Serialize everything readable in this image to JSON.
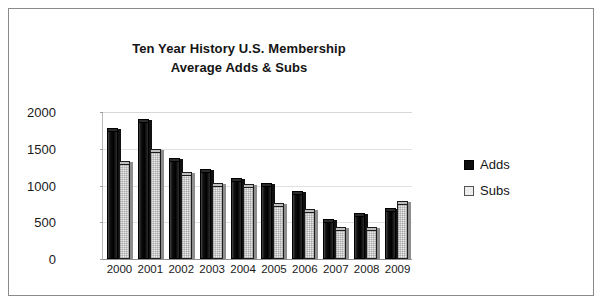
{
  "chart_data": {
    "type": "bar",
    "title": "Ten Year History U.S. Membership",
    "subtitle": "Average Adds & Subs",
    "title_lines": [
      "Ten Year History U.S. Membership",
      "Average Adds & Subs"
    ],
    "xlabel": "",
    "ylabel": "",
    "ylim": [
      0,
      2000
    ],
    "yticks": [
      0,
      500,
      1000,
      1500,
      2000
    ],
    "ytick_labels": [
      "0",
      "500",
      "1000",
      "1500",
      "2000"
    ],
    "grid": true,
    "legend_position": "right",
    "categories": [
      "2000",
      "2001",
      "2002",
      "2003",
      "2004",
      "2005",
      "2006",
      "2007",
      "2008",
      "2009"
    ],
    "series": [
      {
        "name": "Adds",
        "color": "#0d0d0d",
        "values": [
          1780,
          1900,
          1380,
          1230,
          1100,
          1030,
          920,
          550,
          620,
          700
        ]
      },
      {
        "name": "Subs",
        "color": "#ededed",
        "values": [
          1330,
          1500,
          1180,
          1030,
          1020,
          760,
          680,
          430,
          430,
          790
        ]
      }
    ]
  },
  "legend": {
    "items": [
      {
        "label": "Adds"
      },
      {
        "label": "Subs"
      }
    ]
  }
}
